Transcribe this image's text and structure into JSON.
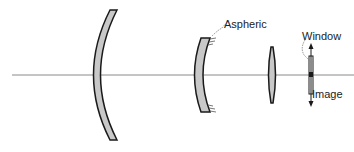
{
  "diagram": {
    "type": "optical-lens-layout",
    "labels": {
      "aspheric": "Aspheric",
      "window": "Window",
      "image": "Image"
    },
    "elements": [
      {
        "id": "lens-1",
        "kind": "meniscus",
        "name": "front meniscus lens"
      },
      {
        "id": "lens-2",
        "kind": "aspheric-concave",
        "name": "aspheric lens"
      },
      {
        "id": "lens-3",
        "kind": "biconvex-thin",
        "name": "thin positive lens"
      },
      {
        "id": "window",
        "kind": "plate",
        "name": "window plate"
      }
    ],
    "colors": {
      "lens_fill": "#c8c8c8",
      "outline": "#1a1a1a",
      "axis": "#888888"
    }
  }
}
